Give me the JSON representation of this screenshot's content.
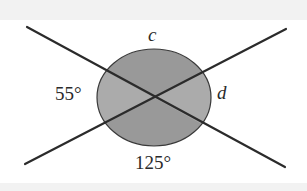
{
  "diagram": {
    "type": "intersecting-lines-angles",
    "labels": {
      "top": "c",
      "right": "d",
      "left": "55°",
      "bottom": "125°"
    },
    "colors": {
      "background_band": "#f2f2f2",
      "canvas": "#ffffff",
      "line": "#2b2b2b",
      "sector_vertical": "#999999",
      "sector_horizontal": "#ababab",
      "circle_outline": "#3a3a3a"
    },
    "angles": [
      {
        "position": "left",
        "value": "55°"
      },
      {
        "position": "bottom",
        "value": "125°"
      },
      {
        "position": "top",
        "value": "c"
      },
      {
        "position": "right",
        "value": "d"
      }
    ]
  }
}
